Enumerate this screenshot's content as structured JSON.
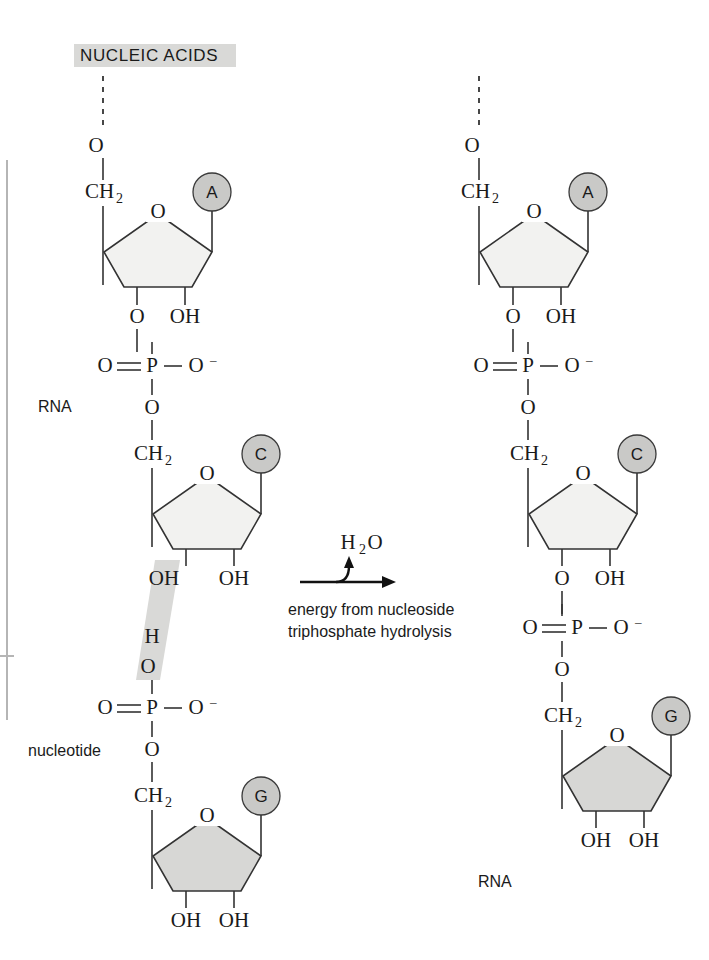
{
  "figure": {
    "title": "NUCLEIC ACIDS",
    "title_highlight_color": "#d9d9d7"
  },
  "colors": {
    "ring_light": "#f2f2f0",
    "ring_dark": "#d7d7d5",
    "base_circle": "#c9c9c7",
    "highlight": "#d9d9d7",
    "stroke": "#333333",
    "text": "#1a1a1a"
  },
  "reaction": {
    "above_arrow": "H",
    "above_arrow_sub": "2",
    "above_arrow_tail": "O",
    "below_arrow_line1": "energy from nucleoside",
    "below_arrow_line2": "triphosphate hydrolysis"
  },
  "labels": {
    "rna_left": "RNA",
    "nucleotide_left": "nucleotide",
    "rna_right": "RNA"
  },
  "atoms": {
    "oxygen": "O",
    "hydroxyl": "OH",
    "phosphorus": "P",
    "ch2": "CH",
    "ch2_sub": "2",
    "oxy_anion": "O",
    "oxy_anion_charge": "–",
    "hydrogen": "H"
  },
  "left_strand": {
    "name": "reactants",
    "nucleotides": [
      {
        "base": "A",
        "sugar_fill": "light",
        "five_prime_link": "O",
        "ch2": "CH2",
        "ring_oxygen": "O",
        "three_prime": "O",
        "two_prime": "OH"
      },
      {
        "base": "C",
        "sugar_fill": "light",
        "ch2": "CH2",
        "ring_oxygen": "O",
        "three_prime": "OH",
        "two_prime": "OH"
      },
      {
        "base": "G",
        "sugar_fill": "dark",
        "ch2": "CH2",
        "ring_oxygen": "O",
        "three_prime": "OH",
        "two_prime": "OH",
        "incoming_phosphate": {
          "double_bond_oxygen": "O",
          "phosphorus": "P",
          "anion_oxygen": "O",
          "bridging_oxygen": "O",
          "hydroxyl_h": "H"
        }
      }
    ],
    "phosphates": [
      {
        "double_bond_oxygen": "O",
        "phosphorus": "P",
        "anion_oxygen": "O",
        "bridging_oxygen": "O"
      }
    ]
  },
  "right_strand": {
    "name": "product",
    "nucleotides": [
      {
        "base": "A",
        "sugar_fill": "light",
        "five_prime_link": "O",
        "ch2": "CH2",
        "ring_oxygen": "O",
        "three_prime": "O",
        "two_prime": "OH"
      },
      {
        "base": "C",
        "sugar_fill": "light",
        "ch2": "CH2",
        "ring_oxygen": "O",
        "three_prime": "O",
        "two_prime": "OH"
      },
      {
        "base": "G",
        "sugar_fill": "dark",
        "ch2": "CH2",
        "ring_oxygen": "O",
        "three_prime": "OH",
        "two_prime": "OH"
      }
    ],
    "phosphates": [
      {
        "double_bond_oxygen": "O",
        "phosphorus": "P",
        "anion_oxygen": "O",
        "bridging_oxygen": "O"
      },
      {
        "double_bond_oxygen": "O",
        "phosphorus": "P",
        "anion_oxygen": "O",
        "bridging_oxygen": "O"
      }
    ]
  }
}
